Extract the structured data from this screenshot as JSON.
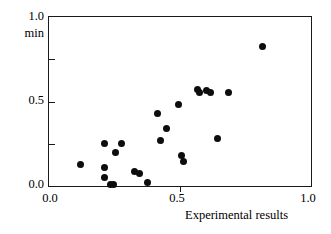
{
  "chart_data": {
    "type": "scatter",
    "title": "",
    "xlabel": "Experimental results",
    "ylabel": "min",
    "xlim": [
      0.0,
      1.0
    ],
    "ylim": [
      0.0,
      1.0
    ],
    "grid": false,
    "legend": "none",
    "x_ticks": [
      "0.0",
      "0.5",
      "1.0"
    ],
    "x_tick_values": [
      0.0,
      0.5,
      1.0
    ],
    "y_ticks": [
      "0.0",
      "0.5",
      "1.0"
    ],
    "y_tick_values": [
      0.0,
      0.5,
      1.0
    ],
    "minor_y_tick_values": [
      0.25,
      0.75
    ],
    "marker": "filled-circle",
    "marker_color": "#0d0d0d",
    "points": [
      {
        "x": 0.12,
        "y": 0.13
      },
      {
        "x": 0.21,
        "y": 0.25
      },
      {
        "x": 0.21,
        "y": 0.11
      },
      {
        "x": 0.21,
        "y": 0.05
      },
      {
        "x": 0.235,
        "y": 0.01
      },
      {
        "x": 0.245,
        "y": 0.01
      },
      {
        "x": 0.255,
        "y": 0.2
      },
      {
        "x": 0.275,
        "y": 0.25
      },
      {
        "x": 0.325,
        "y": 0.085
      },
      {
        "x": 0.345,
        "y": 0.075
      },
      {
        "x": 0.375,
        "y": 0.02
      },
      {
        "x": 0.415,
        "y": 0.43
      },
      {
        "x": 0.425,
        "y": 0.27
      },
      {
        "x": 0.45,
        "y": 0.34
      },
      {
        "x": 0.495,
        "y": 0.48
      },
      {
        "x": 0.505,
        "y": 0.18
      },
      {
        "x": 0.515,
        "y": 0.145
      },
      {
        "x": 0.565,
        "y": 0.57
      },
      {
        "x": 0.575,
        "y": 0.555
      },
      {
        "x": 0.6,
        "y": 0.565
      },
      {
        "x": 0.615,
        "y": 0.555
      },
      {
        "x": 0.645,
        "y": 0.28
      },
      {
        "x": 0.685,
        "y": 0.555
      },
      {
        "x": 0.815,
        "y": 0.825
      }
    ]
  },
  "axes": {
    "y_top_label": "1.0",
    "y_unit_label": "min",
    "y_mid_label": "0.5",
    "y_zero_label": "0.0",
    "x_zero_label": "0.0",
    "x_mid_label": "0.5",
    "x_max_label": "1.0",
    "x_title": "Experimental results"
  },
  "style": {
    "frame_color": "#1a1a1a",
    "background": "#ffffff",
    "marker_color": "#0d0d0d"
  }
}
